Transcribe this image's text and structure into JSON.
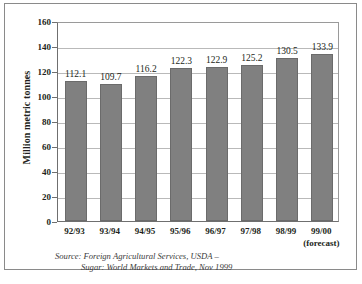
{
  "chart_data": {
    "type": "bar",
    "title": "",
    "xlabel": "",
    "ylabel": "Million metric tonnes",
    "categories": [
      "92/93",
      "93/94",
      "94/95",
      "95/96",
      "96/97",
      "97/98",
      "98/99",
      "99/00"
    ],
    "category_sublabels": [
      "",
      "",
      "",
      "",
      "",
      "",
      "",
      "(forecast)"
    ],
    "values": [
      112.1,
      109.7,
      116.2,
      122.3,
      122.9,
      125.2,
      130.5,
      133.9
    ],
    "value_labels": [
      "112.1",
      "109.7",
      "116.2",
      "122.3",
      "122.9",
      "125.2",
      "130.5",
      "133.9"
    ],
    "ylim": [
      0,
      160
    ],
    "ytick_values": [
      0,
      20,
      40,
      60,
      80,
      100,
      120,
      140,
      160
    ],
    "ytick_labels": [
      "0",
      "20",
      "40",
      "60",
      "80",
      "100",
      "120",
      "140",
      "160"
    ],
    "grid": true,
    "legend": "none",
    "bar_color": "#808080",
    "bar_edge_color": "#6b6b6b",
    "gridline_color": "#b9b9b9",
    "axis_color": "#6f6f6f",
    "text_color": "#231f20"
  },
  "source": {
    "line1": "Source:  Foreign Agricultural Services, USDA –",
    "line2": "Sugar: World Markets and Trade, Nov 1999"
  }
}
